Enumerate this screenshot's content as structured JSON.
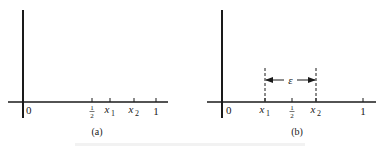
{
  "figure": {
    "panels": [
      {
        "id": "a",
        "caption": "(a)",
        "origin_label": "0",
        "ticks": [
          {
            "name": "half",
            "label_num": "1",
            "label_den": "2",
            "x": 92
          },
          {
            "name": "x1",
            "label_base": "x",
            "label_sub": "1",
            "x": 110
          },
          {
            "name": "x2",
            "label_base": "x",
            "label_sub": "2",
            "x": 134
          },
          {
            "name": "one",
            "label": "1",
            "x": 156
          }
        ]
      },
      {
        "id": "b",
        "caption": "(b)",
        "origin_label": "0",
        "ticks": [
          {
            "name": "x1",
            "label_base": "x",
            "label_sub": "1",
            "x": 265
          },
          {
            "name": "half",
            "label_num": "1",
            "label_den": "2",
            "x": 292
          },
          {
            "name": "x2",
            "label_base": "x",
            "label_sub": "2",
            "x": 316
          },
          {
            "name": "one",
            "label": "1",
            "x": 363
          }
        ],
        "interval_label": "ε"
      }
    ],
    "colors": {
      "ink": "#1a1a1a",
      "background": "#ffffff"
    }
  }
}
